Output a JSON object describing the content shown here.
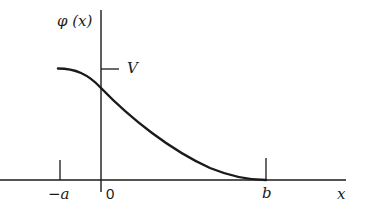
{
  "diagram": {
    "y_axis_label": "φ (x)",
    "x_axis_label": "x",
    "level_label": "V",
    "ticks": {
      "neg_a": "−a",
      "zero": "0",
      "b": "b"
    },
    "colors": {
      "ink": "#1a1a1a",
      "background": "#ffffff"
    }
  }
}
